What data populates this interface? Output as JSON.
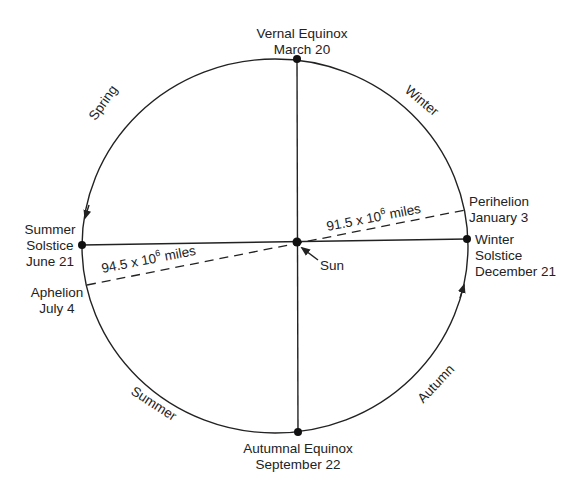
{
  "diagram": {
    "colors": {
      "line": "#222222",
      "background": "#ffffff"
    },
    "points": {
      "vernal_equinox": {
        "line1": "Vernal Equinox",
        "line2": "March 20"
      },
      "winter_solstice": {
        "line1": "Winter",
        "line2": "Solstice",
        "line3": "December 21"
      },
      "summer_solstice": {
        "line1": "Summer",
        "line2": "Solstice",
        "line3": "June 21"
      },
      "autumnal_equinox": {
        "line1": "Autumnal Equinox",
        "line2": "September 22"
      },
      "perihelion": {
        "line1": "Perihelion",
        "line2": "January 3"
      },
      "aphelion": {
        "line1": "Aphelion",
        "line2": "July 4"
      },
      "sun": {
        "label": "Sun"
      }
    },
    "seasons": {
      "spring": "Spring",
      "winter": "Winter",
      "summer": "Summer",
      "autumn": "Autumn"
    },
    "distances": {
      "perihelion": {
        "value": "91.5 x 10",
        "exp": "6",
        "unit": " miles"
      },
      "aphelion": {
        "value": "94.5 x 10",
        "exp": "6",
        "unit": " miles"
      }
    }
  }
}
